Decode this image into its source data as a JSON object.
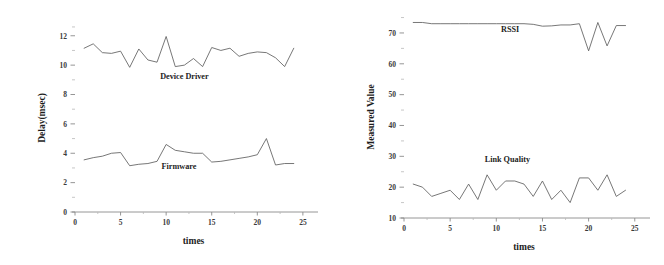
{
  "figure": {
    "background": "#ffffff",
    "line_color": "#5f5f5f",
    "axis_color": "#8a8a8a",
    "text_color": "#1d1d1d"
  },
  "chart_data": [
    {
      "type": "line",
      "panel": "left",
      "title": "",
      "xlabel": "times",
      "ylabel": "Delay(msec)",
      "xlim": [
        0,
        26
      ],
      "ylim": [
        0,
        12.8
      ],
      "xticks": [
        0,
        5,
        10,
        15,
        20,
        25
      ],
      "yticks": [
        0,
        2,
        4,
        6,
        8,
        10,
        12
      ],
      "xtick_labels": [
        "0",
        "5",
        "10",
        "15",
        "20",
        "25"
      ],
      "ytick_labels": [
        "0",
        "2",
        "4",
        "6",
        "8",
        "10",
        "12"
      ],
      "minor_yticks": [
        1,
        3,
        5,
        7,
        9,
        11,
        12.6
      ],
      "grid": false,
      "legend_position": "inline-annotation",
      "x": [
        1,
        2,
        3,
        4,
        5,
        6,
        7,
        8,
        9,
        10,
        11,
        12,
        13,
        14,
        15,
        16,
        17,
        18,
        19,
        20,
        21,
        22,
        23,
        24
      ],
      "series": [
        {
          "name": "Device Driver",
          "label_x": 12.0,
          "label_y": 9.05,
          "values": [
            11.15,
            11.45,
            10.85,
            10.8,
            10.95,
            9.85,
            11.1,
            10.35,
            10.2,
            11.95,
            9.9,
            10.0,
            10.45,
            9.9,
            11.2,
            11.0,
            11.15,
            10.6,
            10.8,
            10.9,
            10.85,
            10.5,
            9.9,
            11.15
          ]
        },
        {
          "name": "Firmware",
          "label_x": 11.4,
          "label_y": 2.95,
          "values": [
            3.55,
            3.7,
            3.8,
            4.0,
            4.05,
            3.15,
            3.25,
            3.3,
            3.45,
            4.6,
            4.2,
            4.1,
            4.0,
            4.0,
            3.4,
            3.45,
            3.55,
            3.65,
            3.75,
            3.9,
            5.0,
            3.2,
            3.3,
            3.3
          ]
        }
      ]
    },
    {
      "type": "line",
      "panel": "right",
      "title": "",
      "xlabel": "times",
      "ylabel": "Measured Value",
      "xlim": [
        0,
        26
      ],
      "ylim": [
        10,
        75.5
      ],
      "xticks": [
        0,
        5,
        10,
        15,
        20,
        25
      ],
      "yticks": [
        10,
        20,
        30,
        40,
        50,
        60,
        70
      ],
      "xtick_labels": [
        "0",
        "5",
        "10",
        "15",
        "20",
        "25"
      ],
      "ytick_labels": [
        "10",
        "20",
        "30",
        "40",
        "50",
        "60",
        "70"
      ],
      "minor_yticks": [
        15,
        25,
        35,
        45,
        55,
        65,
        75
      ],
      "grid": false,
      "legend_position": "inline-annotation",
      "x": [
        1,
        2,
        3,
        4,
        5,
        6,
        7,
        8,
        9,
        10,
        11,
        12,
        13,
        14,
        15,
        16,
        17,
        18,
        19,
        20,
        21,
        22,
        23,
        24
      ],
      "series": [
        {
          "name": "RSSI",
          "label_x": 11.5,
          "label_y": 70.2,
          "values": [
            73.4,
            73.4,
            73.0,
            73.0,
            73.0,
            73.0,
            73.0,
            73.0,
            73.0,
            73.0,
            73.0,
            73.0,
            73.0,
            72.8,
            72.2,
            72.3,
            72.6,
            72.6,
            73.0,
            64.2,
            73.4,
            65.8,
            72.4,
            72.4
          ]
        },
        {
          "name": "Link Quality",
          "label_x": 11.2,
          "label_y": 28.0,
          "values": [
            21,
            20,
            17,
            18,
            19,
            16,
            21,
            16,
            24,
            19,
            22,
            22,
            21,
            17,
            22,
            16,
            19,
            15,
            23,
            23,
            19,
            24,
            17,
            19
          ]
        }
      ]
    }
  ]
}
